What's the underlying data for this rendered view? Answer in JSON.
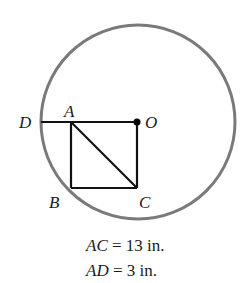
{
  "diagram": {
    "circle": {
      "center_label": "O",
      "stroke_color": "#7a7a7a"
    },
    "points": {
      "D": "D",
      "A": "A",
      "O": "O",
      "B": "B",
      "C": "C"
    },
    "segments": [
      "DO",
      "AB",
      "BC",
      "CO",
      "AC"
    ],
    "givens": [
      {
        "var": "AC",
        "rest": " = 13 in."
      },
      {
        "var": "AD",
        "rest": " = 3 in."
      }
    ]
  }
}
